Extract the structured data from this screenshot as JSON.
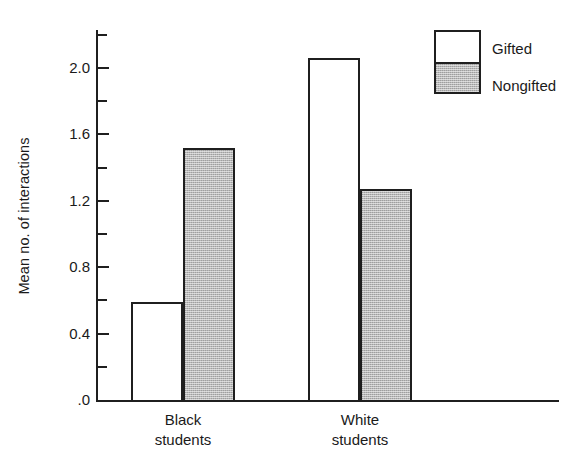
{
  "chart_data": {
    "type": "bar",
    "title": "",
    "xlabel": "",
    "ylabel": "Mean no. of interactions",
    "ylim": [
      0.0,
      2.2
    ],
    "grid": false,
    "legend_position": "top-right",
    "categories": [
      "Black students",
      "White students"
    ],
    "category_lines": [
      [
        "Black",
        "students"
      ],
      [
        "White",
        "students"
      ]
    ],
    "series": [
      {
        "name": "Gifted",
        "style": "open",
        "values": [
          0.59,
          2.06
        ]
      },
      {
        "name": "Nongifted",
        "style": "shaded",
        "values": [
          1.52,
          1.27
        ]
      }
    ],
    "y_ticks_major": [
      "2.0",
      "1.6",
      "1.2",
      "0.8",
      "0.4",
      ".0"
    ],
    "y_tick_values_major": [
      2.0,
      1.6,
      1.2,
      0.8,
      0.4,
      0.0
    ],
    "y_tick_values_minor": [
      2.2,
      1.8,
      1.4,
      1.0,
      0.6,
      0.2
    ],
    "colors": {
      "axis": "#1f1f1f",
      "open_bar": "#ffffff",
      "shaded_bar": "#b8b8b8",
      "text": "#1a1a1a",
      "background": "#ffffff"
    }
  },
  "legend": {
    "entries": [
      {
        "label": "Gifted"
      },
      {
        "label": "Nongifted"
      }
    ]
  }
}
